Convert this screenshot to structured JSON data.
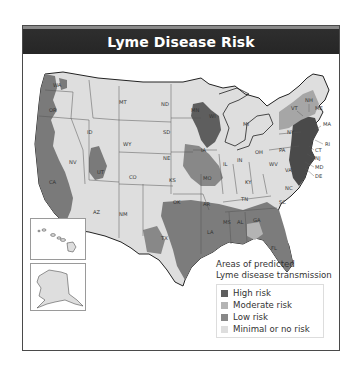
{
  "title": "Lyme Disease Risk",
  "legend": {
    "title_line1": "Areas of predicted",
    "title_line2": "Lyme disease transmission",
    "items": [
      {
        "label": "High risk",
        "color": "#5e5e5e"
      },
      {
        "label": "Moderate risk",
        "color": "#b4b4b4"
      },
      {
        "label": "Low risk",
        "color": "#888888"
      },
      {
        "label": "Minimal or no risk",
        "color": "#dedede"
      }
    ]
  },
  "colors": {
    "high": "#5e5e5e",
    "moderate": "#b4b4b4",
    "low": "#888888",
    "minimal": "#dedede",
    "border": "#333333",
    "title_bg": "#2a2a2a"
  },
  "state_labels": {
    "WA": "WA",
    "OR": "OR",
    "CA": "CA",
    "NV": "NV",
    "ID": "ID",
    "MT": "MT",
    "WY": "WY",
    "UT": "UT",
    "CO": "CO",
    "AZ": "AZ",
    "NM": "NM",
    "ND": "ND",
    "SD": "SD",
    "NE": "NE",
    "KS": "KS",
    "OK": "OK",
    "TX": "TX",
    "MN": "MN",
    "IA": "IA",
    "MO": "MO",
    "AR": "AR",
    "LA": "LA",
    "WI": "WI",
    "IL": "IL",
    "MI": "MI",
    "IN": "IN",
    "OH": "OH",
    "KY": "KY",
    "TN": "TN",
    "MS": "MS",
    "AL": "AL",
    "GA": "GA",
    "FL": "FL",
    "SC": "SC",
    "NC": "NC",
    "VA": "VA",
    "WV": "WV",
    "PA": "PA",
    "NY": "NY",
    "VT": "VT",
    "NH": "NH",
    "ME": "ME",
    "MA": "MA",
    "RI": "RI",
    "CT": "CT",
    "NJ": "NJ",
    "MD": "MD",
    "DE": "DE"
  },
  "insets": {
    "hawaii": "Hawaii",
    "alaska": "Alaska"
  }
}
